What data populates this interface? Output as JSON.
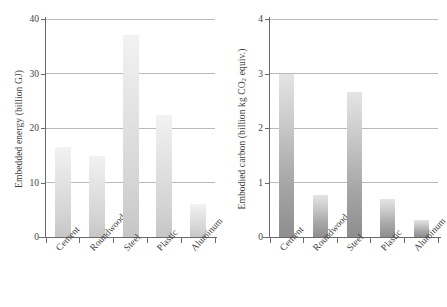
{
  "figure": {
    "width": 447,
    "height": 307,
    "background": "#ffffff",
    "bar_fill_left": "#dcdcdc",
    "bar_fill_right": "#b4b4b4",
    "gridline_color": "#b9b9b9",
    "axis_color": "#6a6a6a"
  },
  "chart_data": [
    {
      "type": "bar",
      "title": "",
      "xlabel": "",
      "ylabel": "Embedded energy (billion GJ)",
      "ylabel_parts": {
        "pre": "Embedded energy (billion GJ)",
        "sub": "",
        "post": ""
      },
      "categories": [
        "Cement",
        "Roundwood",
        "Steel",
        "Plastic",
        "Aluminum"
      ],
      "values": [
        16.5,
        14.8,
        37.0,
        22.3,
        6.1
      ],
      "ylim": [
        0,
        40
      ],
      "yticks": [
        0,
        10,
        20,
        30,
        40
      ],
      "ytick_labels": [
        "0",
        "10",
        "20",
        "30",
        "40"
      ],
      "grid": true,
      "legend": "none"
    },
    {
      "type": "bar",
      "title": "",
      "xlabel": "",
      "ylabel": "Embodied carbon (billion kg CO2 equiv.)",
      "ylabel_parts": {
        "pre": "Embodied carbon (billion kg CO",
        "sub": "2",
        "post": " equiv.)"
      },
      "categories": [
        "Cement",
        "Roundwood",
        "Steel",
        "Plastic",
        "Aluminum"
      ],
      "values": [
        3.0,
        0.77,
        2.66,
        0.7,
        0.31
      ],
      "ylim": [
        0,
        4
      ],
      "yticks": [
        0,
        1,
        2,
        3,
        4
      ],
      "ytick_labels": [
        "0",
        "1",
        "2",
        "3",
        "4"
      ],
      "grid": true,
      "legend": "none"
    }
  ]
}
